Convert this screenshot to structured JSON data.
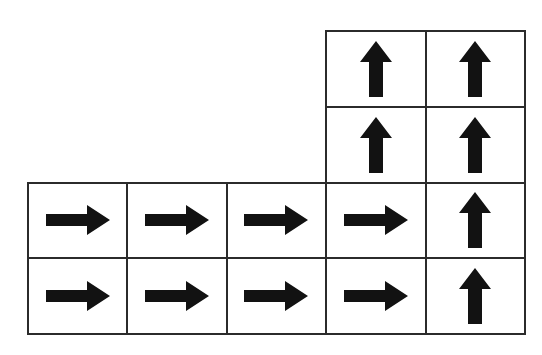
{
  "figure": {
    "background_color": "#ffffff",
    "cell_fill_color": "#ffffff",
    "cell_border_color": "#2b2b2b",
    "arrow_color": "#121212"
  },
  "grid": {
    "columns": 5,
    "rows": 4,
    "origin_x": 27,
    "origin_y": 30,
    "cell_width": 99.4,
    "cell_height": 75.75,
    "border_width": 2
  },
  "legend": {
    "up_label": "up",
    "right_label": "right",
    "empty_label": "empty"
  },
  "chart_data": {
    "type": "heatmap",
    "xlabel": "",
    "ylabel": "",
    "categories": [
      "col 1",
      "col 2",
      "col 3",
      "col 4",
      "col 5"
    ],
    "row_labels": [
      "row 1",
      "row 2",
      "row 3",
      "row 4"
    ],
    "grid": true,
    "legend_position": "none",
    "cells": [
      [
        {
          "id": "r1c1",
          "present": false,
          "arrow": null
        },
        {
          "id": "r1c2",
          "present": false,
          "arrow": null
        },
        {
          "id": "r1c3",
          "present": false,
          "arrow": null
        },
        {
          "id": "r1c4",
          "present": true,
          "arrow": "up"
        },
        {
          "id": "r1c5",
          "present": true,
          "arrow": "up"
        }
      ],
      [
        {
          "id": "r2c1",
          "present": false,
          "arrow": null
        },
        {
          "id": "r2c2",
          "present": false,
          "arrow": null
        },
        {
          "id": "r2c3",
          "present": false,
          "arrow": null
        },
        {
          "id": "r2c4",
          "present": true,
          "arrow": "up"
        },
        {
          "id": "r2c5",
          "present": true,
          "arrow": "up"
        }
      ],
      [
        {
          "id": "r3c1",
          "present": true,
          "arrow": "right"
        },
        {
          "id": "r3c2",
          "present": true,
          "arrow": "right"
        },
        {
          "id": "r3c3",
          "present": true,
          "arrow": "right"
        },
        {
          "id": "r3c4",
          "present": true,
          "arrow": "right"
        },
        {
          "id": "r3c5",
          "present": true,
          "arrow": "up"
        }
      ],
      [
        {
          "id": "r4c1",
          "present": true,
          "arrow": "right"
        },
        {
          "id": "r4c2",
          "present": true,
          "arrow": "right"
        },
        {
          "id": "r4c3",
          "present": true,
          "arrow": "right"
        },
        {
          "id": "r4c4",
          "present": true,
          "arrow": "right"
        },
        {
          "id": "r4c5",
          "present": true,
          "arrow": "up"
        }
      ]
    ],
    "counts": {
      "up_arrows": 6,
      "right_arrows": 8,
      "empty_slots": 6,
      "total_cells": 14
    }
  }
}
